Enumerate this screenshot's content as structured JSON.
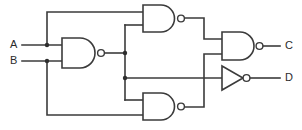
{
  "diagram": {
    "type": "logic-circuit-schematic",
    "background_color": "#ffffff",
    "line_color": "#3b3b3b",
    "label_color": "#2b2b2b"
  },
  "inputs": [
    {
      "id": "A",
      "label": "A",
      "x": 10,
      "y": 45
    },
    {
      "id": "B",
      "label": "B",
      "x": 10,
      "y": 61
    }
  ],
  "outputs": [
    {
      "id": "C",
      "label": "C",
      "x": 285,
      "y": 46
    },
    {
      "id": "D",
      "label": "D",
      "x": 285,
      "y": 78
    }
  ],
  "gates": [
    {
      "id": "gate-nand-1",
      "type": "NAND",
      "label": "NAND",
      "position": "left",
      "inputs": [
        "A",
        "B"
      ],
      "output": "n1"
    },
    {
      "id": "gate-nand-2",
      "type": "NAND",
      "label": "NAND",
      "position": "top",
      "inputs": [
        "A",
        "n1"
      ],
      "output": "n2"
    },
    {
      "id": "gate-nand-3",
      "type": "NAND",
      "label": "NAND",
      "position": "bottom",
      "inputs": [
        "n1",
        "B"
      ],
      "output": "n3"
    },
    {
      "id": "gate-nand-4",
      "type": "NAND",
      "label": "NAND",
      "position": "right",
      "inputs": [
        "n2",
        "n3"
      ],
      "output": "C"
    },
    {
      "id": "gate-not-1",
      "type": "NOT",
      "label": "NOT",
      "position": "right-lower",
      "inputs": [
        "n1"
      ],
      "output": "D"
    }
  ],
  "nets": [
    {
      "id": "A",
      "from": "input-A",
      "to": [
        "gate-nand-1.in1",
        "gate-nand-2.in1"
      ]
    },
    {
      "id": "B",
      "from": "input-B",
      "to": [
        "gate-nand-1.in2",
        "gate-nand-3.in2"
      ]
    },
    {
      "id": "n1",
      "from": "gate-nand-1.out",
      "to": [
        "gate-nand-2.in2",
        "gate-nand-3.in1",
        "gate-not-1.in"
      ]
    },
    {
      "id": "n2",
      "from": "gate-nand-2.out",
      "to": [
        "gate-nand-4.in1"
      ]
    },
    {
      "id": "n3",
      "from": "gate-nand-3.out",
      "to": [
        "gate-nand-4.in2"
      ]
    },
    {
      "id": "C",
      "from": "gate-nand-4.out",
      "to": [
        "output-C"
      ]
    },
    {
      "id": "D",
      "from": "gate-not-1.out",
      "to": [
        "output-D"
      ]
    }
  ],
  "junctions": [
    {
      "id": "j-a",
      "x": 47,
      "y": 45
    },
    {
      "id": "j-b",
      "x": 47,
      "y": 61
    },
    {
      "id": "j-n1-top",
      "x": 125,
      "y": 53
    },
    {
      "id": "j-n1-mid",
      "x": 125,
      "y": 78
    }
  ]
}
